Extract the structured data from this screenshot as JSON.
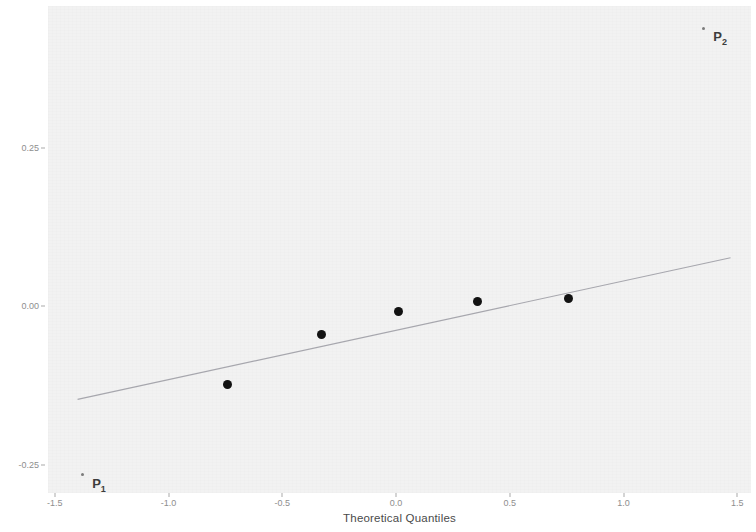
{
  "chart_data": {
    "type": "scatter",
    "title": "",
    "subtitle": "",
    "xlabel": "Theoretical Quantiles",
    "ylabel": "Effect Estimates",
    "xlim": [
      -1.53,
      1.56
    ],
    "ylim": [
      -0.295,
      0.475
    ],
    "xticks": [
      -1.5,
      -1.0,
      -0.5,
      0.0,
      0.5,
      1.0,
      1.5
    ],
    "xticklabels": [
      "-1.5",
      "-1.0",
      "-0.5",
      "0.0",
      "0.5",
      "1.0",
      "1.5"
    ],
    "yticks": [
      0.25,
      0.0,
      -0.25
    ],
    "yticklabels": [
      "0.25",
      "0.00",
      "-0.25"
    ],
    "grid": false,
    "legend": null,
    "panel_background": "#f2f2f2",
    "point_color": "#121212",
    "line_color": "#9a9aa2",
    "points": [
      {
        "x": -0.74,
        "y": -0.124
      },
      {
        "x": -0.33,
        "y": -0.045
      },
      {
        "x": 0.01,
        "y": -0.008
      },
      {
        "x": 0.36,
        "y": 0.008
      },
      {
        "x": 0.76,
        "y": 0.013
      }
    ],
    "annotated_points": [
      {
        "x": -1.38,
        "y": -0.266,
        "label": "P",
        "sub": "1",
        "label_dx": 10,
        "label_dy": 10
      },
      {
        "x": 1.35,
        "y": 0.44,
        "label": "P",
        "sub": "2",
        "label_dx": 10,
        "label_dy": 10
      }
    ],
    "reference_line": {
      "type": "qq-line",
      "x0": -1.4,
      "y0": -0.147,
      "x1": 1.47,
      "y1": 0.077
    }
  }
}
